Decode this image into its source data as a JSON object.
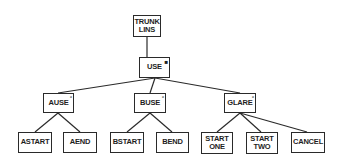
{
  "diagram": {
    "type": "tree",
    "nodes": {
      "root": {
        "label": "TRUNK\nLINS",
        "marker": ""
      },
      "use": {
        "label": "USE",
        "marker": "■"
      },
      "ause": {
        "label": "AUSE",
        "marker": "°"
      },
      "buse": {
        "label": "BUSE",
        "marker": "°"
      },
      "glare": {
        "label": "GLARE",
        "marker": "°"
      },
      "astart": {
        "label": "ASTART",
        "marker": ""
      },
      "aend": {
        "label": "AEND",
        "marker": ""
      },
      "bstart": {
        "label": "BSTART",
        "marker": ""
      },
      "bend": {
        "label": "BEND",
        "marker": ""
      },
      "start_one": {
        "label": "START\nONE",
        "marker": ""
      },
      "start_two": {
        "label": "START\nTWO",
        "marker": ""
      },
      "cancel": {
        "label": "CANCEL",
        "marker": ""
      }
    },
    "edges": [
      [
        "TRUNK LINS",
        "USE"
      ],
      [
        "USE",
        "AUSE"
      ],
      [
        "USE",
        "BUSE"
      ],
      [
        "USE",
        "GLARE"
      ],
      [
        "AUSE",
        "ASTART"
      ],
      [
        "AUSE",
        "AEND"
      ],
      [
        "BUSE",
        "BSTART"
      ],
      [
        "BUSE",
        "BEND"
      ],
      [
        "GLARE",
        "START ONE"
      ],
      [
        "GLARE",
        "START TWO"
      ],
      [
        "GLARE",
        "CANCEL"
      ]
    ]
  }
}
